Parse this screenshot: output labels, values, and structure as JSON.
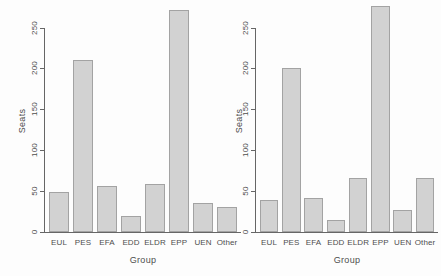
{
  "colors": {
    "background": "#fdfdfd",
    "bar_fill": "#d2d2d2",
    "bar_border": "#a3a3a3",
    "axis": "#666666",
    "text": "#4d4d4d"
  },
  "chart_data": [
    {
      "type": "bar",
      "title": "",
      "xlabel": "Group",
      "ylabel": "Seats",
      "categories": [
        "EUL",
        "PES",
        "EFA",
        "EDD",
        "ELDR",
        "EPP",
        "UEN",
        "Other"
      ],
      "values": [
        49,
        210,
        56,
        19,
        59,
        272,
        35,
        30
      ],
      "yticks": [
        0,
        50,
        100,
        150,
        200,
        250
      ],
      "ylim": [
        0,
        280
      ],
      "grid": false,
      "legend": "none"
    },
    {
      "type": "bar",
      "title": "",
      "xlabel": "Group",
      "ylabel": "Seats",
      "categories": [
        "EUL",
        "PES",
        "EFA",
        "EDD",
        "ELDR",
        "EPP",
        "UEN",
        "Other"
      ],
      "values": [
        39,
        200,
        42,
        15,
        66,
        276,
        27,
        66
      ],
      "yticks": [
        0,
        50,
        100,
        150,
        200,
        250
      ],
      "ylim": [
        0,
        280
      ],
      "grid": false,
      "legend": "none"
    }
  ]
}
